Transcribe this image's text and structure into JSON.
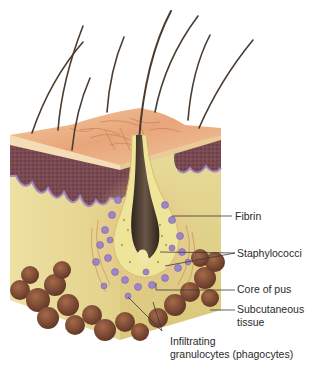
{
  "figure": {
    "labels": {
      "fibrin": "Fibrin",
      "staphylococci": "Staphylococci",
      "core_of_pus": "Core of pus",
      "subcutaneous_line1": "Subcutaneous",
      "subcutaneous_line2": "tissue",
      "infiltrating_line1": "Infiltrating",
      "infiltrating_line2": "granulocytes (phagocytes)"
    },
    "colors": {
      "background": "#ffffff",
      "epidermis": "#f0b98e",
      "epidermis_dark": "#b8734a",
      "dermis_layer": "#7a4a4e",
      "dermis_edge": "#a58ac0",
      "connective": "#e4d690",
      "fat": "#7a4630",
      "hair": "#4a3c30",
      "follicle_wall": "#eee59a",
      "granulocyte": "#9d86c8",
      "label_text": "#2a2a2a",
      "leader_line": "#3a3a3a"
    }
  }
}
